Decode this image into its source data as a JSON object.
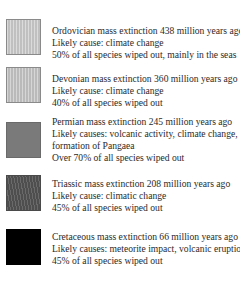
{
  "legend": {
    "entries": [
      {
        "name": "ordovician",
        "swatch_color": "#c8c8c8",
        "lines": [
          "Ordovician mass extinction 438 million years ago",
          "Likely cause: climate change",
          "50% of all species wiped out, mainly in the seas"
        ]
      },
      {
        "name": "devonian",
        "swatch_color": "#c4c4c4",
        "lines": [
          "Devonian mass extinction 360 million years ago",
          "Likely cause: climate change",
          "40% of all species wiped out"
        ]
      },
      {
        "name": "permian",
        "swatch_color": "#7a7a7a",
        "lines": [
          "Permian mass extinction 245 million years ago",
          "Likely causes: volcanic activity, climate change,",
          "formation of Pangaea",
          "Over 70% of all species wiped out"
        ]
      },
      {
        "name": "triassic",
        "swatch_color": "#555555",
        "lines": [
          "Triassic mass extinction 208 million years ago",
          "Likely cause: climatic change",
          "45% of all species wiped out"
        ]
      },
      {
        "name": "cretaceous",
        "swatch_color": "#000000",
        "lines": [
          "Cretaceous mass extinction 66 million years ago",
          "Likely causes: meteorite impact, volcanic eruptions",
          "45% of all species wiped out"
        ]
      }
    ]
  }
}
